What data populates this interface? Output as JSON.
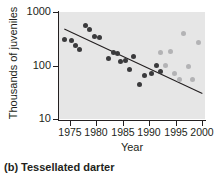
{
  "caption": "(b) Tessellated darter",
  "chart_data": {
    "type": "scatter",
    "title": "",
    "xlabel": "Year",
    "ylabel": "Thousands of juveniles",
    "xlim": [
      1973,
      2000.5
    ],
    "ylim": [
      10,
      1000
    ],
    "yscale": "log",
    "xticks": [
      1975,
      1980,
      1985,
      1990,
      1995,
      2000
    ],
    "xtick_labels": [
      "1975",
      "1980",
      "1985",
      "1990",
      "1995",
      "2000"
    ],
    "yticks": [
      10,
      100,
      1000
    ],
    "ytick_labels": [
      "10",
      "100",
      "1000"
    ],
    "grid": false,
    "legend": "none",
    "plot_background": "#e6e6e6",
    "colors": {
      "dark_points": "#3a3a3c",
      "light_points": "#b3b3b5",
      "trendline": "#231f20",
      "axis": "#231f20"
    },
    "series": [
      {
        "name": "Early survey years",
        "marker_color": "#3a3a3c",
        "points": [
          {
            "x": 1974.0,
            "y": 300
          },
          {
            "x": 1975.3,
            "y": 290
          },
          {
            "x": 1976.2,
            "y": 240
          },
          {
            "x": 1976.9,
            "y": 195
          },
          {
            "x": 1978.0,
            "y": 560
          },
          {
            "x": 1978.8,
            "y": 470
          },
          {
            "x": 1979.6,
            "y": 350
          },
          {
            "x": 1980.6,
            "y": 340
          },
          {
            "x": 1982.4,
            "y": 135
          },
          {
            "x": 1983.2,
            "y": 175
          },
          {
            "x": 1984.1,
            "y": 165
          },
          {
            "x": 1984.6,
            "y": 120
          },
          {
            "x": 1985.5,
            "y": 125
          },
          {
            "x": 1986.3,
            "y": 85
          },
          {
            "x": 1987.1,
            "y": 150
          },
          {
            "x": 1988.2,
            "y": 45
          },
          {
            "x": 1989.1,
            "y": 65
          },
          {
            "x": 1990.4,
            "y": 72
          },
          {
            "x": 1991.3,
            "y": 100
          },
          {
            "x": 1992.2,
            "y": 78
          }
        ]
      },
      {
        "name": "Later survey years",
        "marker_color": "#b3b3b5",
        "points": [
          {
            "x": 1992.2,
            "y": 175
          },
          {
            "x": 1993.0,
            "y": 100
          },
          {
            "x": 1994.0,
            "y": 185
          },
          {
            "x": 1994.8,
            "y": 70
          },
          {
            "x": 1995.7,
            "y": 55
          },
          {
            "x": 1996.5,
            "y": 400
          },
          {
            "x": 1997.4,
            "y": 95
          },
          {
            "x": 1998.2,
            "y": 55
          },
          {
            "x": 1999.2,
            "y": 270
          }
        ]
      }
    ],
    "trendline": {
      "x_start": 1974.0,
      "y_start": 480,
      "x_end": 2000.0,
      "y_end": 30
    }
  }
}
